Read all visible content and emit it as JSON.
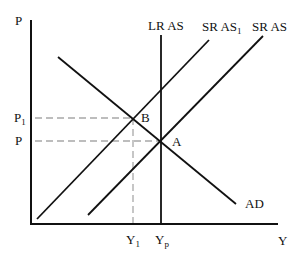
{
  "diagram": {
    "title": "",
    "axes": {
      "y_label": "P",
      "x_label": "Y"
    },
    "curves": {
      "lras": {
        "label": "LR AS"
      },
      "sras1": {
        "label": "SR AS",
        "subscript": "1"
      },
      "sras": {
        "label": "SR AS"
      },
      "ad": {
        "label": "AD"
      }
    },
    "points": {
      "a": {
        "label": "A"
      },
      "b": {
        "label": "B"
      }
    },
    "price_levels": {
      "p1": {
        "label": "P",
        "subscript": "1"
      },
      "p": {
        "label": "P"
      }
    },
    "output_levels": {
      "y1": {
        "label": "Y",
        "subscript": "1"
      },
      "yp": {
        "label": "Y",
        "subscript": "p"
      }
    },
    "colors": {
      "line": "#111111",
      "dashed": "#a0a0a0",
      "background": "#ffffff"
    }
  }
}
